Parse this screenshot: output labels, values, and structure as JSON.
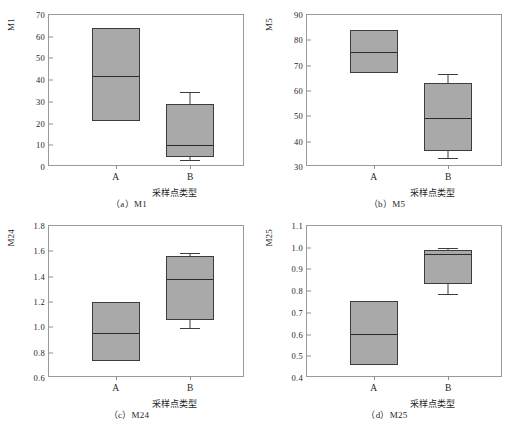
{
  "figure": {
    "panels": [
      {
        "key": "a",
        "caption": "（a）M1",
        "ylabel": "M1",
        "xlabel": "采样点类型",
        "yticks": [
          "0",
          "10",
          "20",
          "30",
          "40",
          "50",
          "60",
          "70"
        ],
        "ytickvals": [
          0,
          10,
          20,
          30,
          40,
          50,
          60,
          70
        ],
        "ylim": [
          0,
          70
        ],
        "categories": [
          "A",
          "B"
        ]
      },
      {
        "key": "b",
        "caption": "（b）M5",
        "ylabel": "M5",
        "xlabel": "采样点类型",
        "yticks": [
          "30",
          "40",
          "50",
          "60",
          "70",
          "80",
          "90"
        ],
        "ytickvals": [
          30,
          40,
          50,
          60,
          70,
          80,
          90
        ],
        "ylim": [
          30,
          90
        ],
        "categories": [
          "A",
          "B"
        ]
      },
      {
        "key": "c",
        "caption": "（c）M24",
        "ylabel": "M24",
        "xlabel": "采样点类型",
        "yticks": [
          "0.6",
          "0.8",
          "1.0",
          "1.2",
          "1.4",
          "1.6",
          "1.8"
        ],
        "ytickvals": [
          0.6,
          0.8,
          1.0,
          1.2,
          1.4,
          1.6,
          1.8
        ],
        "ylim": [
          0.6,
          1.8
        ],
        "categories": [
          "A",
          "B"
        ]
      },
      {
        "key": "d",
        "caption": "（d）M25",
        "ylabel": "M25",
        "xlabel": "采样点类型",
        "yticks": [
          "0.4",
          "0.5",
          "0.6",
          "0.7",
          "0.8",
          "0.9",
          "1.0",
          "1.1"
        ],
        "ytickvals": [
          0.4,
          0.5,
          0.6,
          0.7,
          0.8,
          0.9,
          1.0,
          1.1
        ],
        "ylim": [
          0.4,
          1.1
        ],
        "categories": [
          "A",
          "B"
        ]
      }
    ]
  },
  "chart_data": [
    {
      "type": "box",
      "title": "（a）M1",
      "xlabel": "采样点类型",
      "ylabel": "M1",
      "ylim": [
        0,
        70
      ],
      "ytick_step": 10,
      "grid": false,
      "legend": null,
      "categories": [
        "A",
        "B"
      ],
      "boxes": [
        {
          "category": "A",
          "q1": 21.0,
          "median": 42.5,
          "q3": 64.0,
          "whisker_low": null,
          "whisker_high": null
        },
        {
          "category": "B",
          "q1": 4.7,
          "median": 10.5,
          "q3": 29.2,
          "whisker_low": 3.0,
          "whisker_high": 34.5
        }
      ]
    },
    {
      "type": "box",
      "title": "（b）M5",
      "xlabel": "采样点类型",
      "ylabel": "M5",
      "ylim": [
        30,
        90
      ],
      "ytick_step": 10,
      "grid": false,
      "legend": null,
      "categories": [
        "A",
        "B"
      ],
      "boxes": [
        {
          "category": "A",
          "q1": 67.0,
          "median": 75.6,
          "q3": 84.2,
          "whisker_low": null,
          "whisker_high": null
        },
        {
          "category": "B",
          "q1": 36.2,
          "median": 49.6,
          "q3": 63.0,
          "whisker_low": 33.7,
          "whisker_high": 66.8
        }
      ]
    },
    {
      "type": "box",
      "title": "（c）M24",
      "xlabel": "采样点类型",
      "ylabel": "M24",
      "ylim": [
        0.6,
        1.8
      ],
      "ytick_step": 0.2,
      "grid": false,
      "legend": null,
      "categories": [
        "A",
        "B"
      ],
      "boxes": [
        {
          "category": "A",
          "q1": 0.735,
          "median": 0.965,
          "q3": 1.2,
          "whisker_low": null,
          "whisker_high": null
        },
        {
          "category": "B",
          "q1": 1.055,
          "median": 1.39,
          "q3": 1.565,
          "whisker_low": 0.995,
          "whisker_high": 1.585
        }
      ]
    },
    {
      "type": "box",
      "title": "（d）M25",
      "xlabel": "采样点类型",
      "ylabel": "M25",
      "ylim": [
        0.4,
        1.1
      ],
      "ytick_step": 0.1,
      "grid": false,
      "legend": null,
      "categories": [
        "A",
        "B"
      ],
      "boxes": [
        {
          "category": "A",
          "q1": 0.462,
          "median": 0.607,
          "q3": 0.755,
          "whisker_low": null,
          "whisker_high": null
        },
        {
          "category": "B",
          "q1": 0.832,
          "median": 0.975,
          "q3": 0.99,
          "whisker_low": 0.787,
          "whisker_high": 1.0
        }
      ]
    }
  ],
  "style": {
    "box_fill": "#a9a9a9",
    "box_stroke": "#3d3d3d",
    "median_stroke": "#2b2b2b",
    "axis_stroke": "#9a9a9a",
    "background": "#ffffff"
  }
}
